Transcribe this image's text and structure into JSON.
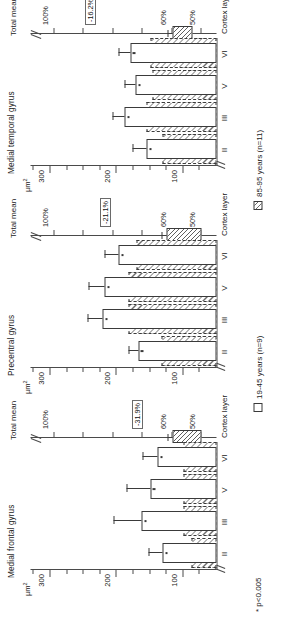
{
  "figure": {
    "y_axis_unit": "µm",
    "y_axis_unit_sup": "2",
    "x_axis_title": "Cortex layer",
    "total_mean_title": "Total mean",
    "p_note": "* p<0.005",
    "y_ticks": [
      "300",
      "200",
      "100"
    ],
    "cortex_layers": [
      "II",
      "III",
      "V",
      "VI"
    ]
  },
  "legend": {
    "items": [
      {
        "label": "19-45 years (n=9)",
        "swatch": "open-white"
      },
      {
        "label": "85-95 years (n=11)",
        "swatch": "hatched-grey"
      }
    ]
  },
  "chart_data": {
    "type": "bar",
    "ylabel": "µm²",
    "xlabel": "Cortex layer",
    "ylim": [
      50,
      330
    ],
    "grid": false,
    "legend_position": "bottom",
    "categories": [
      "II",
      "III",
      "V",
      "VI"
    ],
    "panels": [
      {
        "title": "Medial frontal gyrus",
        "series": [
          {
            "name": "19-45 years (n=9)",
            "values": [
              131,
              163,
              150,
              139
            ],
            "errors": [
              22,
              42,
              36,
              22
            ],
            "significant": [
              true,
              true,
              true,
              true
            ]
          },
          {
            "name": "85-95 years (n=11)",
            "values": [
              88,
              100,
              100,
              100
            ],
            "errors": [
              0,
              0,
              0,
              0
            ],
            "significant": [
              false,
              false,
              false,
              false
            ]
          }
        ],
        "total_mean": {
          "reference_label": "100%",
          "reference_value": 100,
          "change_label": "-31.9%",
          "change_value": 68.1,
          "bar_low": 50,
          "bar_high": 60,
          "tick_labels": [
            "100%",
            "60%",
            "50%"
          ]
        }
      },
      {
        "title": "Precentral gyrus",
        "series": [
          {
            "name": "19-45 years (n=9)",
            "values": [
              168,
              222,
              219,
              197
            ],
            "errors": [
              14,
              22,
              24,
              22
            ],
            "significant": [
              true,
              true,
              true,
              true
            ]
          },
          {
            "name": "85-95 years (n=11)",
            "values": [
              133,
              182,
              182,
              170
            ],
            "errors": [
              0,
              0,
              0,
              0
            ],
            "significant": [
              false,
              false,
              false,
              false
            ]
          }
        ],
        "total_mean": {
          "reference_label": "100%",
          "reference_value": 100,
          "change_label": "-21.1%",
          "change_value": 78.9,
          "bar_low": 50,
          "bar_high": 62,
          "tick_labels": [
            "100%",
            "60%",
            "50%"
          ]
        }
      },
      {
        "title": "Medial temporal gyrus",
        "series": [
          {
            "name": "19-45 years (n=9)",
            "values": [
              155,
              188,
              172,
              180
            ],
            "errors": [
              22,
              18,
              17,
              17
            ],
            "significant": [
              true,
              true,
              true,
              true
            ]
          },
          {
            "name": "85-95 years (n=11)",
            "values": [
              131,
              156,
              147,
              150
            ],
            "errors": [
              0,
              0,
              0,
              0
            ],
            "significant": [
              false,
              false,
              false,
              false
            ]
          }
        ],
        "total_mean": {
          "reference_label": "100%",
          "reference_value": 100,
          "change_label": "-16.2%",
          "change_value": 83.8,
          "bar_low": 53,
          "bar_high": 60,
          "tick_labels": [
            "100%",
            "60%",
            "50%"
          ]
        }
      }
    ]
  }
}
